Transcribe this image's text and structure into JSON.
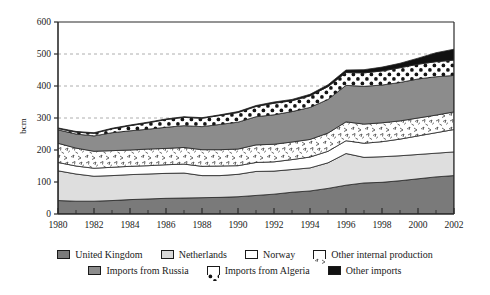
{
  "chart_data": {
    "type": "area",
    "title": "",
    "subtitle": "",
    "xlabel": "",
    "ylabel": "bcm",
    "stacked": true,
    "grid": "horizontal-dashed",
    "legend_position": "bottom",
    "xlim": [
      1980,
      2002
    ],
    "ylim": [
      0,
      600
    ],
    "yticks": [
      0,
      100,
      200,
      300,
      400,
      500,
      600
    ],
    "ytick_labels": [
      "0",
      "100",
      "200",
      "300",
      "400",
      "500",
      "600"
    ],
    "xticks": [
      1980,
      1982,
      1984,
      1986,
      1988,
      1990,
      1992,
      1994,
      1996,
      1998,
      2000,
      2002
    ],
    "xtick_labels": [
      "1980",
      "1982",
      "1984",
      "1986",
      "1988",
      "1990",
      "1992",
      "1994",
      "1996",
      "1998",
      "2000",
      "2002"
    ],
    "x": [
      1980,
      1981,
      1982,
      1983,
      1984,
      1985,
      1986,
      1987,
      1988,
      1989,
      1990,
      1991,
      1992,
      1993,
      1994,
      1995,
      1996,
      1997,
      1998,
      1999,
      2000,
      2001,
      2002
    ],
    "series": [
      {
        "name": "United Kingdom",
        "fill": "#7a7a7a",
        "pattern": "solid",
        "values": [
          42,
          40,
          40,
          42,
          45,
          47,
          49,
          50,
          51,
          52,
          54,
          58,
          62,
          68,
          72,
          80,
          90,
          97,
          99,
          104,
          110,
          116,
          120
        ]
      },
      {
        "name": "Netherlands",
        "fill": "#dedede",
        "pattern": "solid",
        "values": [
          93,
          85,
          78,
          78,
          78,
          78,
          78,
          78,
          69,
          68,
          70,
          75,
          72,
          71,
          72,
          80,
          99,
          80,
          80,
          78,
          76,
          74,
          74
        ]
      },
      {
        "name": "Norway",
        "fill": "#ffffff",
        "pattern": "solid",
        "values": [
          26,
          25,
          25,
          26,
          26,
          26,
          27,
          28,
          29,
          30,
          27,
          28,
          29,
          31,
          34,
          36,
          40,
          44,
          47,
          52,
          58,
          64,
          70
        ]
      },
      {
        "name": "Other internal production",
        "fill": "#ffffff",
        "pattern": "stipple",
        "values": [
          60,
          56,
          53,
          52,
          51,
          52,
          51,
          52,
          52,
          51,
          52,
          55,
          55,
          55,
          55,
          57,
          59,
          60,
          59,
          57,
          56,
          55,
          55
        ]
      },
      {
        "name": "Imports from Russia",
        "fill": "#8c8c8c",
        "pattern": "solid",
        "values": [
          42,
          44,
          48,
          56,
          60,
          62,
          66,
          68,
          72,
          79,
          84,
          88,
          92,
          95,
          100,
          105,
          114,
          118,
          118,
          120,
          122,
          120,
          114
        ]
      },
      {
        "name": "Imports from Algeria",
        "fill": "#ffffff",
        "pattern": "polka",
        "values": [
          4,
          6,
          8,
          12,
          16,
          20,
          24,
          26,
          26,
          28,
          30,
          32,
          36,
          34,
          36,
          40,
          40,
          42,
          44,
          46,
          46,
          47,
          48
        ]
      },
      {
        "name": "Other imports",
        "fill": "#111111",
        "pattern": "solid",
        "values": [
          2,
          2,
          2,
          2,
          2,
          2,
          2,
          2,
          2,
          2,
          3,
          3,
          4,
          4,
          5,
          6,
          8,
          10,
          12,
          14,
          19,
          28,
          34
        ]
      }
    ],
    "totals": [
      269,
      258,
      254,
      268,
      278,
      287,
      297,
      304,
      301,
      310,
      320,
      339,
      350,
      358,
      374,
      404,
      450,
      451,
      459,
      471,
      487,
      504,
      515
    ]
  },
  "legend": {
    "rows": [
      [
        {
          "label": "United Kingdom",
          "swatch": "uk"
        },
        {
          "label": "Netherlands",
          "swatch": "neth"
        },
        {
          "label": "Norway",
          "swatch": "norway"
        },
        {
          "label": "Other internal production",
          "swatch": "oip"
        }
      ],
      [
        {
          "label": "Imports from Russia",
          "swatch": "russia"
        },
        {
          "label": "Imports from Algeria",
          "swatch": "algeria"
        },
        {
          "label": "Other imports",
          "swatch": "other"
        }
      ]
    ]
  }
}
